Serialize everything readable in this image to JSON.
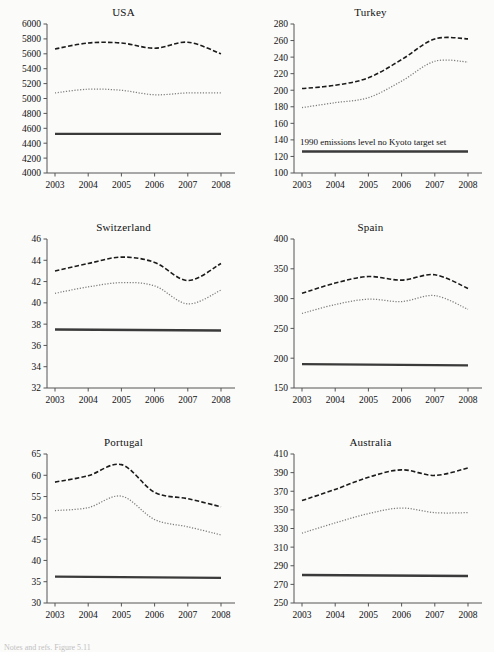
{
  "figure": {
    "background": "#fbfbfa",
    "layout": "2 columns x 3 rows of small-multiple line charts",
    "caption_fragment": "Notes and refs. Figure 5.11"
  },
  "series_styles": {
    "dashed_label": "dashed-series",
    "dotted_label": "dotted-series",
    "solid_label": "1990-emissions-level-solid-series",
    "dashed_color": "#1b1b1b",
    "dotted_color": "#7d7d7d",
    "solid_color": "#3a3a3a"
  },
  "chart_data": [
    {
      "type": "line",
      "title": "USA",
      "xlabel": "",
      "ylabel": "",
      "x": [
        2003,
        2004,
        2005,
        2006,
        2007,
        2008
      ],
      "xtick_labels": [
        "2003",
        "2004",
        "2005",
        "2006",
        "2007",
        "2008"
      ],
      "ylim": [
        4000,
        6000
      ],
      "ytick_labels": [
        "4000",
        "4200",
        "4400",
        "4600",
        "4800",
        "5000",
        "5200",
        "5400",
        "5600",
        "5800",
        "6000"
      ],
      "yticks": [
        4000,
        4200,
        4400,
        4600,
        4800,
        5000,
        5200,
        5400,
        5600,
        5800,
        6000
      ],
      "grid": false,
      "legend": "none",
      "series": [
        {
          "name": "dashed",
          "style": "dashed",
          "values": [
            5665,
            5745,
            5745,
            5675,
            5755,
            5600
          ]
        },
        {
          "name": "dotted",
          "style": "dotted",
          "values": [
            5075,
            5125,
            5110,
            5050,
            5075,
            5075
          ]
        },
        {
          "name": "1990 level",
          "style": "solid",
          "values": [
            4525,
            4525,
            4525,
            4525,
            4525,
            4525
          ]
        }
      ],
      "annotation": ""
    },
    {
      "type": "line",
      "title": "Turkey",
      "xlabel": "",
      "ylabel": "",
      "x": [
        2003,
        2004,
        2005,
        2006,
        2007,
        2008
      ],
      "xtick_labels": [
        "2003",
        "2004",
        "2005",
        "2006",
        "2007",
        "2008"
      ],
      "ylim": [
        100,
        280
      ],
      "ytick_labels": [
        "100",
        "120",
        "140",
        "160",
        "180",
        "200",
        "220",
        "240",
        "260",
        "280"
      ],
      "yticks": [
        100,
        120,
        140,
        160,
        180,
        200,
        220,
        240,
        260,
        280
      ],
      "grid": false,
      "legend": "none",
      "series": [
        {
          "name": "dashed",
          "style": "dashed",
          "values": [
            202,
            206,
            215,
            237,
            262,
            262
          ]
        },
        {
          "name": "dotted",
          "style": "dotted",
          "values": [
            179,
            185,
            191,
            211,
            235,
            234
          ]
        },
        {
          "name": "1990 level",
          "style": "solid",
          "values": [
            126,
            126,
            126,
            126,
            126,
            126
          ]
        }
      ],
      "annotation": "1990 emissions level no Kyoto target set"
    },
    {
      "type": "line",
      "title": "Switzerland",
      "xlabel": "",
      "ylabel": "",
      "x": [
        2003,
        2004,
        2005,
        2006,
        2007,
        2008
      ],
      "xtick_labels": [
        "2003",
        "2004",
        "2005",
        "2006",
        "2007",
        "2008"
      ],
      "ylim": [
        32,
        46
      ],
      "ytick_labels": [
        "32",
        "34",
        "36",
        "38",
        "40",
        "42",
        "44",
        "46"
      ],
      "yticks": [
        32,
        34,
        36,
        38,
        40,
        42,
        44,
        46
      ],
      "grid": false,
      "legend": "none",
      "series": [
        {
          "name": "dashed",
          "style": "dashed",
          "values": [
            43.0,
            43.7,
            44.3,
            43.8,
            42.1,
            43.7
          ]
        },
        {
          "name": "dotted",
          "style": "dotted",
          "values": [
            40.9,
            41.5,
            41.9,
            41.6,
            39.9,
            41.2
          ]
        },
        {
          "name": "1990 level",
          "style": "solid",
          "values": [
            37.5,
            37.5,
            37.4,
            37.4,
            37.4,
            37.4
          ]
        }
      ],
      "annotation": ""
    },
    {
      "type": "line",
      "title": "Spain",
      "xlabel": "",
      "ylabel": "",
      "x": [
        2003,
        2004,
        2005,
        2006,
        2007,
        2008
      ],
      "xtick_labels": [
        "2003",
        "2004",
        "2005",
        "2006",
        "2007",
        "2008"
      ],
      "ylim": [
        150,
        400
      ],
      "ytick_labels": [
        "150",
        "200",
        "250",
        "300",
        "350",
        "400"
      ],
      "yticks": [
        150,
        200,
        250,
        300,
        350,
        400
      ],
      "grid": false,
      "legend": "none",
      "series": [
        {
          "name": "dashed",
          "style": "dashed",
          "values": [
            309,
            326,
            337,
            331,
            340,
            317
          ]
        },
        {
          "name": "dotted",
          "style": "dotted",
          "values": [
            275,
            290,
            299,
            295,
            305,
            282
          ]
        },
        {
          "name": "1990 level",
          "style": "solid",
          "values": [
            190,
            190,
            189,
            189,
            189,
            188
          ]
        }
      ],
      "annotation": ""
    },
    {
      "type": "line",
      "title": "Portugal",
      "xlabel": "",
      "ylabel": "",
      "x": [
        2003,
        2004,
        2005,
        2006,
        2007,
        2008
      ],
      "xtick_labels": [
        "2003",
        "2004",
        "2005",
        "2006",
        "2007",
        "2008"
      ],
      "ylim": [
        30,
        65
      ],
      "ytick_labels": [
        "30",
        "35",
        "40",
        "45",
        "50",
        "55",
        "60",
        "65"
      ],
      "yticks": [
        30,
        35,
        40,
        45,
        50,
        55,
        60,
        65
      ],
      "grid": false,
      "legend": "none",
      "series": [
        {
          "name": "dashed",
          "style": "dashed",
          "values": [
            58.4,
            59.9,
            62.5,
            56.0,
            54.5,
            52.6
          ]
        },
        {
          "name": "dotted",
          "style": "dotted",
          "values": [
            51.7,
            52.4,
            55.1,
            49.6,
            47.9,
            46.0
          ]
        },
        {
          "name": "1990 level",
          "style": "solid",
          "values": [
            36.2,
            36.1,
            36.1,
            36.0,
            36.0,
            35.9
          ]
        }
      ],
      "annotation": ""
    },
    {
      "type": "line",
      "title": "Australia",
      "xlabel": "",
      "ylabel": "",
      "x": [
        2003,
        2004,
        2005,
        2006,
        2007,
        2008
      ],
      "xtick_labels": [
        "2003",
        "2004",
        "2005",
        "2006",
        "2007",
        "2008"
      ],
      "ylim": [
        250,
        410
      ],
      "ytick_labels": [
        "250",
        "270",
        "290",
        "310",
        "330",
        "350",
        "370",
        "390",
        "410"
      ],
      "yticks": [
        250,
        270,
        290,
        310,
        330,
        350,
        370,
        390,
        410
      ],
      "grid": false,
      "legend": "none",
      "series": [
        {
          "name": "dashed",
          "style": "dashed",
          "values": [
            360,
            372,
            385,
            393,
            387,
            395
          ]
        },
        {
          "name": "dotted",
          "style": "dotted",
          "values": [
            325,
            336,
            346,
            352,
            347,
            347
          ]
        },
        {
          "name": "1990 level",
          "style": "solid",
          "values": [
            280,
            280,
            280,
            280,
            280,
            279
          ]
        }
      ],
      "annotation": ""
    }
  ]
}
